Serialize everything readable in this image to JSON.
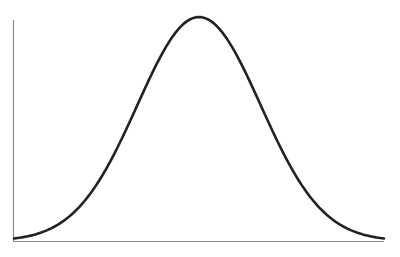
{
  "chart_data": {
    "type": "line",
    "title": "",
    "xlabel": "",
    "ylabel": "",
    "grid": false,
    "legend": null,
    "series": [
      {
        "name": "normal-curve",
        "distribution": "gaussian",
        "mean": 0,
        "std": 1,
        "x_range": [
          -3,
          3
        ]
      }
    ],
    "x": [
      -3,
      -2.5,
      -2,
      -1.5,
      -1,
      -0.5,
      0,
      0.5,
      1,
      1.5,
      2,
      2.5,
      3
    ],
    "values": [
      0.004,
      0.018,
      0.054,
      0.13,
      0.242,
      0.352,
      0.399,
      0.352,
      0.242,
      0.13,
      0.054,
      0.018,
      0.004
    ],
    "xlim": [
      -3,
      3
    ],
    "ylim": [
      0,
      0.4
    ],
    "colors": {
      "curve": "#222222",
      "axis": "#8a8a8a"
    }
  }
}
